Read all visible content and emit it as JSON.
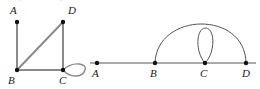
{
  "figure": {
    "clipped_caption_text": "Graphs and Loops",
    "background_color": "#ffffff",
    "width": 260,
    "height": 89
  },
  "style": {
    "left_edge_color": "#8a8a8a",
    "left_edge_width": 2,
    "right_edge_color": "#555555",
    "right_edge_width": 1,
    "vertex_color": "#111111",
    "vertex_radius": 2.2,
    "label_color": "#1a1a1a"
  },
  "graphs": [
    {
      "id": "left-graph",
      "name": "quadrilateral-graph-with-loop",
      "vertices": [
        {
          "id": "A",
          "label": "A",
          "x": 17,
          "y": 22,
          "label_x": 10,
          "label_y": 14
        },
        {
          "id": "D",
          "label": "D",
          "x": 63,
          "y": 22,
          "label_x": 68,
          "label_y": 14
        },
        {
          "id": "B",
          "label": "B",
          "x": 17,
          "y": 70,
          "label_x": 8,
          "label_y": 84
        },
        {
          "id": "C",
          "label": "C",
          "x": 63,
          "y": 70,
          "label_x": 59,
          "label_y": 84
        }
      ],
      "edges": [
        {
          "from": "A",
          "to": "B",
          "kind": "line"
        },
        {
          "from": "B",
          "to": "D",
          "kind": "line"
        },
        {
          "from": "B",
          "to": "C",
          "kind": "line"
        },
        {
          "from": "D",
          "to": "C",
          "kind": "line"
        }
      ],
      "loops": [
        {
          "at": "C",
          "orientation": "horizontal-right",
          "path": "M 63 70 C 74 60, 88 64, 85 70 C 83 77, 71 79, 63 70 Z"
        }
      ]
    },
    {
      "id": "right-graph",
      "name": "collinear-path-graph-with-arc-and-loop",
      "vertices": [
        {
          "id": "A",
          "label": "A",
          "x": 97,
          "y": 63,
          "label_x": 92,
          "label_y": 77
        },
        {
          "id": "B",
          "label": "B",
          "x": 155,
          "y": 63,
          "label_x": 150,
          "label_y": 77
        },
        {
          "id": "C",
          "label": "C",
          "x": 205,
          "y": 63,
          "label_x": 200,
          "label_y": 77
        },
        {
          "id": "D",
          "label": "D",
          "x": 246,
          "y": 63,
          "label_x": 242,
          "label_y": 77
        }
      ],
      "edges": [
        {
          "from": "A",
          "to": "B",
          "kind": "line"
        },
        {
          "from": "B",
          "to": "C",
          "kind": "line"
        },
        {
          "from": "C",
          "to": "D",
          "kind": "line"
        }
      ],
      "arcs": [
        {
          "from": "B",
          "to": "D",
          "kind": "arc",
          "path": "M 155 63 C 157 12, 245 10, 246 63"
        }
      ],
      "loops": [
        {
          "at": "C",
          "orientation": "vertical-up",
          "path": "M 205 63 C 195 52, 196 29, 205 28 C 215 27, 216 52, 205 63 Z"
        }
      ],
      "baseline": {
        "x1": 90,
        "x2": 256,
        "y": 63
      }
    }
  ]
}
